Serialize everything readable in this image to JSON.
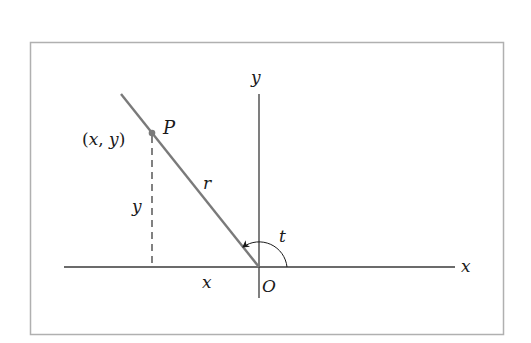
{
  "diagram": {
    "type": "polar-coordinates",
    "labels": {
      "x_axis": "x",
      "y_axis": "y",
      "origin": "O",
      "point": "P",
      "point_coords_open": "(",
      "point_coords_x": "x",
      "point_coords_sep": ", ",
      "point_coords_y": "y",
      "point_coords_close": ")",
      "radius": "r",
      "angle": "t",
      "vertical_leg": "y",
      "horizontal_leg": "x"
    },
    "colors": {
      "frame": "#b0b0b0",
      "axes": "#3a3a3a",
      "ray": "#7a7a7a",
      "point": "#7a7a7a",
      "text": "#1a1a1a"
    }
  }
}
